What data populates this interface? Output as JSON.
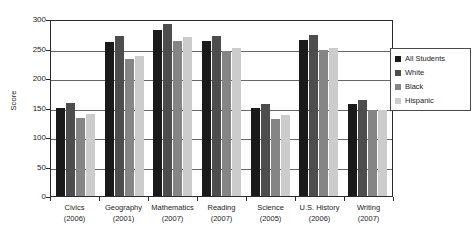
{
  "chart_data": {
    "type": "bar",
    "title": "",
    "xlabel": "",
    "ylabel": "Score",
    "ylim": [
      0,
      300
    ],
    "yticks": [
      0,
      50,
      100,
      150,
      200,
      250,
      300
    ],
    "grid": true,
    "legend_position": "right",
    "categories": [
      "Civics",
      "Geography",
      "Mathematics",
      "Reading",
      "Science",
      "U.S. History",
      "Writing"
    ],
    "category_years": [
      "(2006)",
      "(2001)",
      "(2007)",
      "(2007)",
      "(2005)",
      "(2006)",
      "(2007)"
    ],
    "series": [
      {
        "name": "All Students",
        "color": "#1a1a1a",
        "values": [
          150,
          261,
          281,
          263,
          150,
          265,
          156
        ]
      },
      {
        "name": "White",
        "color": "#4d4d4d",
        "values": [
          158,
          272,
          291,
          272,
          156,
          273,
          162
        ]
      },
      {
        "name": "Black",
        "color": "#858585",
        "values": [
          133,
          232,
          262,
          246,
          130,
          248,
          146
        ]
      },
      {
        "name": "Hispanic",
        "color": "#cccccc",
        "values": [
          139,
          238,
          270,
          251,
          137,
          251,
          146
        ]
      }
    ]
  },
  "legend": {
    "items": [
      {
        "label": "All Students",
        "color": "#1a1a1a"
      },
      {
        "label": "White",
        "color": "#4d4d4d"
      },
      {
        "label": "Black",
        "color": "#858585"
      },
      {
        "label": "Hispanic",
        "color": "#cccccc"
      }
    ]
  },
  "axis": {
    "y_title": "Score",
    "y_tick_labels": [
      "300",
      "250",
      "200",
      "150",
      "100",
      "50",
      "0"
    ]
  }
}
